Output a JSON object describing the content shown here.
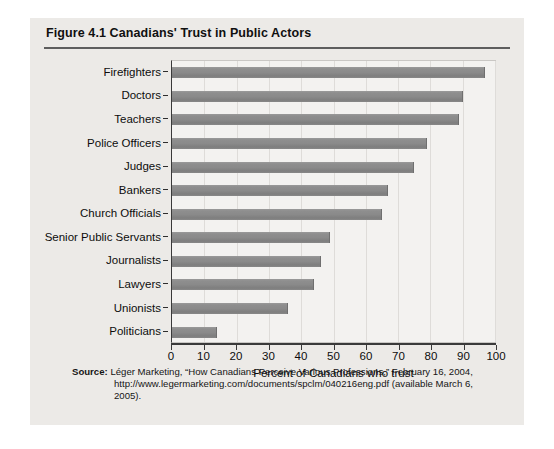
{
  "figure": {
    "title": "Figure 4.1  Canadians' Trust in Public Actors",
    "source_label": "Source:",
    "source_line1": "Léger Marketing, “How Canadians Perceive Various Professions,” February 16, 2004,",
    "source_line2": "http://www.legermarketing.com/documents/spclm/040216eng.pdf (available March 6,",
    "source_line3": "2005)."
  },
  "chart_data": {
    "type": "bar",
    "orientation": "horizontal",
    "title": "Canadians' Trust in Public Actors",
    "xlabel": "Percent of Canadians who trust",
    "ylabel": "",
    "xlim": [
      0,
      100
    ],
    "xticks": [
      0,
      10,
      20,
      30,
      40,
      50,
      60,
      70,
      80,
      90,
      100
    ],
    "grid": true,
    "legend": false,
    "bar_color": "#8a8a8a",
    "categories": [
      "Firefighters",
      "Doctors",
      "Teachers",
      "Police Officers",
      "Judges",
      "Bankers",
      "Church Officials",
      "Senior Public Servants",
      "Journalists",
      "Lawyers",
      "Unionists",
      "Politicians"
    ],
    "values": [
      97,
      90,
      89,
      79,
      75,
      67,
      65,
      49,
      46,
      44,
      36,
      14
    ]
  }
}
